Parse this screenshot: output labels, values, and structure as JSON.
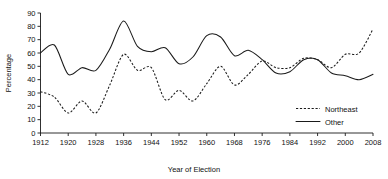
{
  "chart_data": {
    "type": "line",
    "title": "",
    "xlabel": "Year of Election",
    "ylabel": "Percentage",
    "xlim": [
      1912,
      2008
    ],
    "ylim": [
      0,
      90
    ],
    "grid": false,
    "legend_position": "right-lower",
    "x": [
      1912,
      1916,
      1920,
      1924,
      1928,
      1932,
      1936,
      1940,
      1944,
      1948,
      1952,
      1956,
      1960,
      1964,
      1968,
      1972,
      1976,
      1980,
      1984,
      1988,
      1992,
      1996,
      2000,
      2004,
      2008
    ],
    "x_ticks": [
      "1912",
      "1920",
      "1928",
      "1936",
      "1944",
      "1952",
      "1960",
      "1968",
      "1976",
      "1984",
      "1992",
      "2000",
      "2008"
    ],
    "y_ticks": [
      "0",
      "10",
      "20",
      "30",
      "40",
      "50",
      "60",
      "70",
      "80",
      "90"
    ],
    "series": [
      {
        "name": "Northeast",
        "style": "dashed",
        "color": "#1a1a1a",
        "values": [
          31,
          27,
          15,
          24,
          15,
          36,
          59,
          47,
          49,
          25,
          32,
          24,
          37,
          50,
          36,
          44,
          54,
          49,
          49,
          56,
          55,
          49,
          59,
          60,
          78
        ]
      },
      {
        "name": "Other",
        "style": "solid",
        "color": "#1a1a1a",
        "values": [
          60,
          66,
          44,
          49,
          47,
          63,
          84,
          65,
          61,
          64,
          52,
          57,
          73,
          72,
          58,
          62,
          55,
          45,
          46,
          55,
          55,
          45,
          43,
          40,
          44
        ]
      }
    ],
    "annotations": []
  },
  "legend": {
    "entries": [
      {
        "label": "Northeast",
        "style": "dashed"
      },
      {
        "label": "Other",
        "style": "solid"
      }
    ]
  },
  "axes": {
    "y_title": "Percentage",
    "x_title": "Year of Election"
  }
}
